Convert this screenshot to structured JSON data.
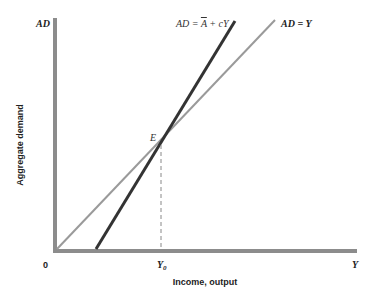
{
  "chart_data": {
    "type": "line",
    "title": "",
    "xlabel": "Income, output",
    "ylabel": "Aggregate demand",
    "axis_labels": {
      "y_top": "AD",
      "x_right": "Y",
      "origin": "0"
    },
    "x_ticks": [
      {
        "label": "Y0",
        "sub": "0",
        "position": "equilibrium"
      }
    ],
    "series": [
      {
        "name": "AD = Y",
        "label": "AD = Y",
        "kind": "45-degree line",
        "color": "#9a9a9a",
        "points": [
          [
            0,
            0
          ],
          [
            1,
            1
          ]
        ]
      },
      {
        "name": "AD = Ā + cY",
        "label_main": "AD = ",
        "label_bar": "A",
        "label_rest": " + cY",
        "kind": "aggregate demand schedule",
        "color": "#333333",
        "points": [
          [
            0.13,
            0
          ],
          [
            0.6,
            1
          ]
        ]
      }
    ],
    "annotations": [
      {
        "text": "E",
        "meaning": "equilibrium point where AD = Y",
        "dashed_drop_to": "Y0"
      }
    ],
    "grid": false,
    "legend": "inline labels at line ends"
  },
  "colors": {
    "axis": "#8c8c8c",
    "ad_line": "#333333",
    "y_line": "#9a9a9a",
    "dash": "#888888"
  }
}
